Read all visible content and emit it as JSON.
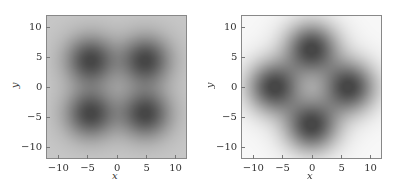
{
  "chart_data": [
    {
      "type": "heatmap",
      "title": "",
      "xlabel": "x",
      "ylabel": "y",
      "xlim": [
        -12,
        12
      ],
      "ylim": [
        -12,
        12
      ],
      "xticks": [
        -10,
        -5,
        0,
        5,
        10
      ],
      "yticks": [
        -10,
        -5,
        0,
        5,
        10
      ],
      "xtick_labels": [
        "−10",
        "−5",
        "0",
        "5",
        "10"
      ],
      "ytick_labels": [
        "−10",
        "−5",
        "0",
        "5",
        "10"
      ],
      "colormap": "grayscale (dark = high intensity)",
      "background_level": 0.78,
      "description": "Four dark lobes in diagonal quadrants separated by a light cross along x=0 and y=0",
      "lobes": [
        {
          "x": -4.5,
          "y": 4.5
        },
        {
          "x": 5.0,
          "y": 4.5
        },
        {
          "x": -4.5,
          "y": -4.5
        },
        {
          "x": 5.0,
          "y": -4.5
        }
      ],
      "lobe_sigma": 3.0,
      "grid": false,
      "legend": null
    },
    {
      "type": "heatmap",
      "title": "",
      "xlabel": "x",
      "ylabel": "y",
      "xlim": [
        -12,
        12
      ],
      "ylim": [
        -12,
        12
      ],
      "xticks": [
        -10,
        -5,
        0,
        5,
        10
      ],
      "yticks": [
        -10,
        -5,
        0,
        5,
        10
      ],
      "xtick_labels": [
        "−10",
        "−5",
        "0",
        "5",
        "10"
      ],
      "ytick_labels": [
        "−10",
        "−5",
        "0",
        "5",
        "10"
      ],
      "colormap": "grayscale (dark = high intensity)",
      "background_level": 0.97,
      "description": "Four dark lobes on the axes separated by light diagonal bands along y=x and y=-x",
      "lobes": [
        {
          "x": 0,
          "y": 6.5
        },
        {
          "x": 0,
          "y": -6.5
        },
        {
          "x": -6.5,
          "y": 0
        },
        {
          "x": 6.5,
          "y": 0
        }
      ],
      "lobe_sigma": 3.2,
      "grid": false,
      "legend": null
    }
  ]
}
